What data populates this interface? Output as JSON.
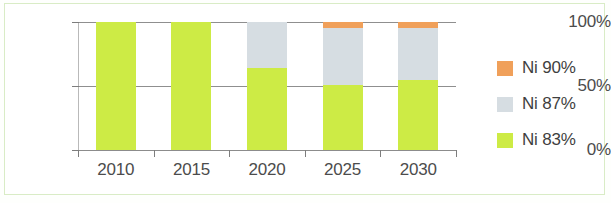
{
  "chart_data": {
    "type": "bar",
    "title": "",
    "subtitle": "",
    "xlabel": "",
    "ylabel": "",
    "stacked": true,
    "stack_mode": "percent",
    "grid": true,
    "legend_position": "right",
    "categories": [
      "2010",
      "2015",
      "2020",
      "2025",
      "2030"
    ],
    "ylim": [
      0,
      100
    ],
    "ytick_labels": [
      "100%",
      "50%",
      "0%"
    ],
    "ytick_values": [
      100,
      50,
      0
    ],
    "series": [
      {
        "name": "Ni 83%",
        "color": "#cdeb45",
        "values": [
          100,
          100,
          64,
          51,
          55
        ]
      },
      {
        "name": "Ni 87%",
        "color": "#d6dde2",
        "values": [
          0,
          0,
          36,
          44,
          40
        ]
      },
      {
        "name": "Ni 90%",
        "color": "#f0a05a",
        "values": [
          0,
          0,
          0,
          5,
          5
        ]
      }
    ],
    "legend_entries": [
      {
        "label": "Ni 90%",
        "color": "#f0a05a"
      },
      {
        "label": "Ni 87%",
        "color": "#d6dde2"
      },
      {
        "label": "Ni 83%",
        "color": "#cdeb45"
      }
    ]
  },
  "axis": {
    "y": {
      "tick_100": "100%",
      "tick_50": "50%",
      "tick_0": "0%"
    },
    "x": {
      "tick_0": "2010",
      "tick_1": "2015",
      "tick_2": "2020",
      "tick_3": "2025",
      "tick_4": "2030"
    }
  },
  "legend": {
    "row_0_label": "Ni 90%",
    "row_1_label": "Ni 87%",
    "row_2_label": "Ni 83%"
  }
}
